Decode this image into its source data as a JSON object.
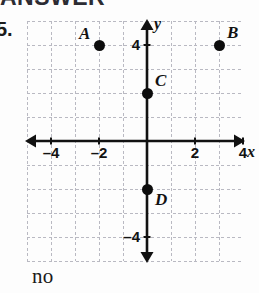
{
  "page": {
    "heading": "ANSWER",
    "question_number": "5.",
    "answer_text": "no"
  },
  "chart_data": {
    "type": "scatter",
    "title": "",
    "xlabel": "x",
    "ylabel": "y",
    "xlim": [
      -5,
      4
    ],
    "ylim": [
      -5,
      5
    ],
    "grid": true,
    "grid_step": 1,
    "legend": "none",
    "x_ticks": [
      {
        "value": -4,
        "label": "–4"
      },
      {
        "value": -2,
        "label": "–2"
      },
      {
        "value": 2,
        "label": "2"
      },
      {
        "value": 4,
        "label": "4"
      }
    ],
    "y_ticks": [
      {
        "value": 4,
        "label": "4"
      },
      {
        "value": -4,
        "label": "–4"
      }
    ],
    "points": [
      {
        "label": "A",
        "x": -2,
        "y": 4,
        "label_pos": "upper-left"
      },
      {
        "label": "B",
        "x": 3,
        "y": 4,
        "label_pos": "upper-right"
      },
      {
        "label": "C",
        "x": 0,
        "y": 2,
        "label_pos": "upper-right"
      },
      {
        "label": "D",
        "x": 0,
        "y": -2,
        "label_pos": "lower-right"
      }
    ],
    "axis_arrows": [
      "left",
      "right",
      "up",
      "down"
    ]
  },
  "colors": {
    "axis": "#111111",
    "grid": "#b9b9c2",
    "point": "#0d0d0d",
    "text": "#121212",
    "heading": "#2c2c33",
    "background": "#fdfdfd"
  }
}
